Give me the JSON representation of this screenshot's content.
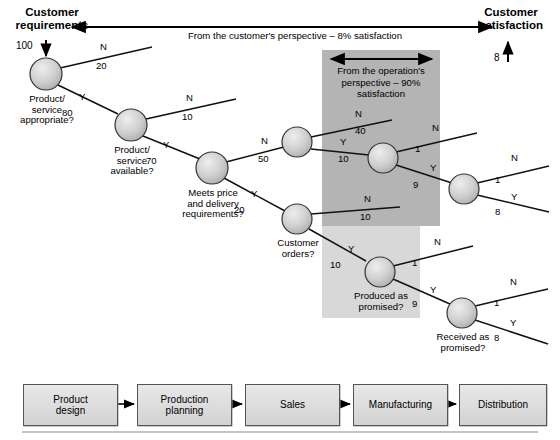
{
  "header": {
    "left_title_line1": "Customer",
    "left_title_line2": "requirements",
    "right_title_line1": "Customer",
    "right_title_line2": "satisfaction",
    "top_band_text": "From the customer's perspective – 8% satisfaction",
    "start_value": "100",
    "end_value": "8"
  },
  "operation_band": {
    "line1": "From the operation's",
    "line2": "perspective – 90%",
    "line3": "satisfaction"
  },
  "nodes": [
    {
      "id": "n1",
      "caption_lines": [
        "Product/",
        "service",
        "appropriate?"
      ],
      "cx": 46,
      "cy": 74,
      "r": 16
    },
    {
      "id": "n2",
      "caption_lines": [
        "Product/",
        "service",
        "available?"
      ],
      "cx": 131,
      "cy": 125,
      "r": 16
    },
    {
      "id": "n3",
      "caption_lines": [
        "Meets price",
        "and delivery",
        "requirements?"
      ],
      "cx": 212,
      "cy": 168,
      "r": 16
    },
    {
      "id": "n4",
      "caption_lines": [],
      "cx": 297,
      "cy": 142,
      "r": 15
    },
    {
      "id": "n5",
      "caption_lines": [],
      "cx": 383,
      "cy": 158,
      "r": 15
    },
    {
      "id": "n6",
      "caption_lines": [],
      "cx": 464,
      "cy": 189,
      "r": 15
    },
    {
      "id": "n7",
      "caption_lines": [
        "Customer",
        "orders?"
      ],
      "cx": 297,
      "cy": 219,
      "r": 15
    },
    {
      "id": "n8",
      "caption_lines": [
        "Produced as",
        "promised?"
      ],
      "cx": 380,
      "cy": 272,
      "r": 15
    },
    {
      "id": "n9",
      "caption_lines": [
        "Received as",
        "promised?"
      ],
      "cx": 462,
      "cy": 313,
      "r": 15
    }
  ],
  "branches": [
    {
      "from": "n1",
      "answer": "N",
      "value": "20"
    },
    {
      "from": "n1",
      "answer": "Y",
      "value": "80"
    },
    {
      "from": "n2",
      "answer": "N",
      "value": "10"
    },
    {
      "from": "n2",
      "answer": "Y",
      "value": "70"
    },
    {
      "from": "n3",
      "answer": "N",
      "value": "50"
    },
    {
      "from": "n3",
      "answer": "Y",
      "value": "20"
    },
    {
      "from": "n4",
      "answer": "N",
      "value": "40"
    },
    {
      "from": "n4",
      "answer": "Y",
      "value": "10"
    },
    {
      "from": "n5",
      "answer": "N",
      "value": "1"
    },
    {
      "from": "n5",
      "answer": "Y",
      "value": "9"
    },
    {
      "from": "n6",
      "answer": "N",
      "value": "1"
    },
    {
      "from": "n6",
      "answer": "Y",
      "value": "8"
    },
    {
      "from": "n7",
      "answer": "N",
      "value": "10"
    },
    {
      "from": "n7",
      "answer": "Y",
      "value": "10"
    },
    {
      "from": "n8",
      "answer": "N",
      "value": "1"
    },
    {
      "from": "n8",
      "answer": "Y",
      "value": "9"
    },
    {
      "from": "n9",
      "answer": "N",
      "value": "1"
    },
    {
      "from": "n9",
      "answer": "Y",
      "value": "8"
    }
  ],
  "process_chain": [
    {
      "label_lines": [
        "Product",
        "design"
      ]
    },
    {
      "label_lines": [
        "Production",
        "planning"
      ]
    },
    {
      "label_lines": [
        "Sales"
      ]
    },
    {
      "label_lines": [
        "Manufacturing"
      ]
    },
    {
      "label_lines": [
        "Distribution"
      ]
    }
  ],
  "colors": {
    "band_dark": "#b4b4b4",
    "band_light": "#d8d8d8",
    "node_fill": "#c9c9c9",
    "line": "#1a1a1a",
    "box_fill": "#dcdcdc",
    "rule": "#b0b0b0"
  }
}
